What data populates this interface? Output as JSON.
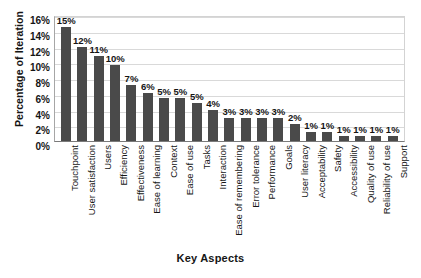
{
  "chart_data": {
    "type": "bar",
    "title": "",
    "xlabel": "Key Aspects",
    "ylabel": "Percentage of Iteration",
    "ylim": [
      0,
      16
    ],
    "ytick_labels": [
      "16%",
      "14%",
      "12%",
      "10%",
      "8%",
      "6%",
      "4%",
      "2%",
      "0%"
    ],
    "ytick_values": [
      16,
      14,
      12,
      10,
      8,
      6,
      4,
      2,
      0
    ],
    "grid": true,
    "legend": "none",
    "categories": [
      "Touchpoint",
      "User satisfaction",
      "Users",
      "Efficiency",
      "Effectiveness",
      "Ease of learning",
      "Context",
      "Ease of use",
      "Tasks",
      "Interaction",
      "Ease of remembering",
      "Error tolerance",
      "Performance",
      "Goals",
      "User literacy",
      "Acceptability",
      "Safety",
      "Accessibility",
      "Quality of use",
      "Reliability of use",
      "Support"
    ],
    "values": [
      15,
      12,
      11,
      10,
      7,
      6,
      5,
      5,
      5,
      4,
      3,
      3,
      3,
      3,
      2,
      1,
      1,
      1,
      1,
      1,
      1
    ],
    "bar_heights": [
      14.5,
      12.0,
      10.8,
      9.6,
      7.1,
      6.1,
      5.4,
      5.4,
      4.8,
      4.0,
      2.9,
      2.9,
      2.9,
      2.9,
      2.2,
      1.2,
      1.2,
      0.7,
      0.7,
      0.7,
      0.7
    ],
    "data_labels": [
      "15%",
      "12%",
      "11%",
      "10%",
      "7%",
      "6%",
      "5%",
      "5%",
      "5%",
      "4%",
      "3%",
      "3%",
      "3%",
      "3%",
      "2%",
      "1%",
      "1%",
      "1%",
      "1%",
      "1%",
      "1%"
    ],
    "bar_color": "#4a4a4a",
    "grid_color": "#d9d9d9",
    "background": "#ffffff"
  },
  "caption": ""
}
